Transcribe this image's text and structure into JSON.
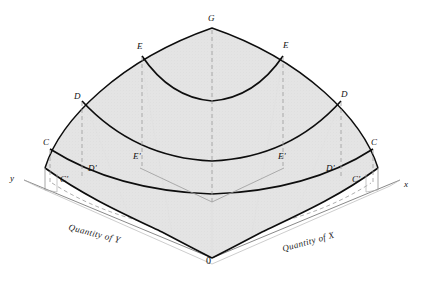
{
  "figure": {
    "kind": "3d-utility-surface-diagram",
    "background_color": "#ffffff",
    "surface_fill_color": "#e3e3e3",
    "surface_edge_color": "#000000",
    "contour_color": "#000000",
    "projection_line_color": "#8a8a8a",
    "axis_color": "#4a4a4a"
  },
  "axes": {
    "x_axis_label": "x",
    "y_axis_label": "y",
    "origin_label": "0",
    "x_caption": "Quantity of X",
    "y_caption": "Quantity of Y"
  },
  "surface_labels": {
    "apex": "G",
    "contour_e_left": "E",
    "contour_e_right": "E",
    "contour_d_left": "D",
    "contour_d_right": "D",
    "contour_c_left": "C",
    "contour_c_right": "C"
  },
  "projection_labels": {
    "e_prime_left": "E'",
    "e_prime_right": "E'",
    "d_prime_left": "D'",
    "d_prime_right": "D'",
    "c_prime_left": "C'",
    "c_prime_right": "C'"
  },
  "contours": [
    {
      "id": "G",
      "kind": "apex-point",
      "level": 4
    },
    {
      "id": "E",
      "kind": "indifference-contour",
      "level": 3,
      "projection": "E'"
    },
    {
      "id": "D",
      "kind": "indifference-contour",
      "level": 2,
      "projection": "D'"
    },
    {
      "id": "C",
      "kind": "indifference-contour",
      "level": 1,
      "projection": "C'"
    }
  ]
}
